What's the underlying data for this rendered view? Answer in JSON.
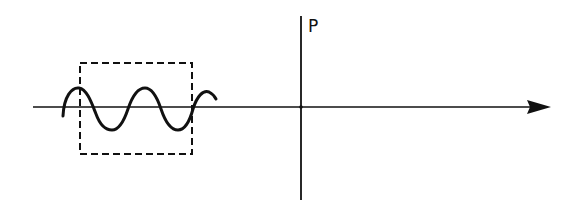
{
  "diagram": {
    "point_label": "P",
    "elements": {
      "horizontal_axis": {
        "x1": 33,
        "y1": 107,
        "x2": 530,
        "y2": 107,
        "arrow": "right"
      },
      "vertical_line": {
        "x": 301,
        "y1": 16,
        "y2": 200
      },
      "dashed_box": {
        "x": 80,
        "y": 63,
        "width": 112,
        "height": 91
      },
      "wave": {
        "start_x": 62,
        "end_x": 216,
        "center_y": 107,
        "amplitude": 22,
        "periods": 2.5
      }
    },
    "colors": {
      "stroke": "#111111",
      "background": "#ffffff"
    }
  }
}
